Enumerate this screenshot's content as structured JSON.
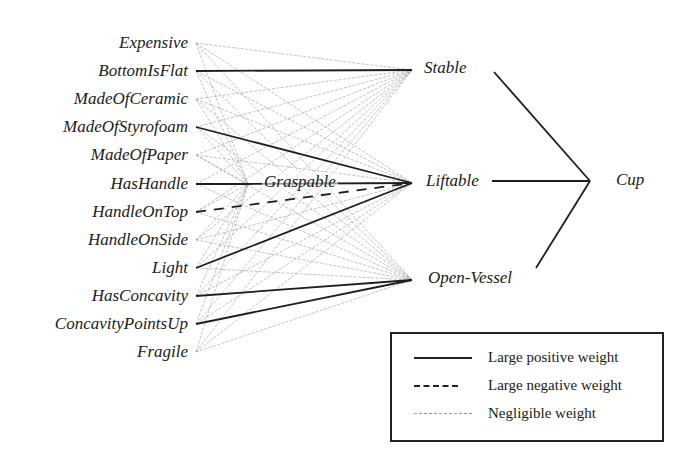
{
  "diagram": {
    "type": "neural-network",
    "input_nodes": [
      {
        "label": "Expensive",
        "y": 43
      },
      {
        "label": "BottomIsFlat",
        "y": 71
      },
      {
        "label": "MadeOfCeramic",
        "y": 99
      },
      {
        "label": "MadeOfStyrofoam",
        "y": 127
      },
      {
        "label": "MadeOfPaper",
        "y": 155
      },
      {
        "label": "HasHandle",
        "y": 184
      },
      {
        "label": "HandleOnTop",
        "y": 212
      },
      {
        "label": "HandleOnSide",
        "y": 240
      },
      {
        "label": "Light",
        "y": 268
      },
      {
        "label": "HasConcavity",
        "y": 296
      },
      {
        "label": "ConcavityPointsUp",
        "y": 324
      },
      {
        "label": "Fragile",
        "y": 352
      }
    ],
    "hidden_nodes": [
      {
        "label": "Graspable",
        "x": 248,
        "y": 184
      },
      {
        "label": "Stable",
        "x": 412,
        "y": 70
      },
      {
        "label": "Liftable",
        "x": 412,
        "y": 183
      },
      {
        "label": "Open-Vessel",
        "x": 412,
        "y": 280
      }
    ],
    "output_node": {
      "label": "Cup",
      "x": 602,
      "y": 181
    },
    "strong_edges": [
      {
        "from": "BottomIsFlat",
        "to": "Stable",
        "weight": "positive"
      },
      {
        "from": "MadeOfStyrofoam",
        "to": "Liftable",
        "weight": "positive"
      },
      {
        "from": "HasHandle",
        "to": "Graspable",
        "weight": "positive"
      },
      {
        "from": "HandleOnTop",
        "to": "Liftable",
        "weight": "negative"
      },
      {
        "from": "Graspable",
        "to": "Liftable",
        "weight": "positive"
      },
      {
        "from": "Light",
        "to": "Liftable",
        "weight": "positive"
      },
      {
        "from": "HasConcavity",
        "to": "Open-Vessel",
        "weight": "positive"
      },
      {
        "from": "ConcavityPointsUp",
        "to": "Open-Vessel",
        "weight": "positive"
      },
      {
        "from": "Stable",
        "to": "Cup",
        "weight": "positive"
      },
      {
        "from": "Liftable",
        "to": "Cup",
        "weight": "positive"
      },
      {
        "from": "Open-Vessel",
        "to": "Cup",
        "weight": "positive"
      }
    ],
    "other_edges": "negligible weight (all remaining input-to-hidden connections)"
  },
  "legend": {
    "items": [
      {
        "style": "solid",
        "label": "Large positive weight"
      },
      {
        "style": "dashed",
        "label": "Large negative weight"
      },
      {
        "style": "faint-dashed",
        "label": "Negligible weight"
      }
    ]
  },
  "colors": {
    "strong_line": "#1e1e1e",
    "negligible_line": "#9a9a9a",
    "text": "#1a1a1a",
    "background": "#ffffff"
  }
}
